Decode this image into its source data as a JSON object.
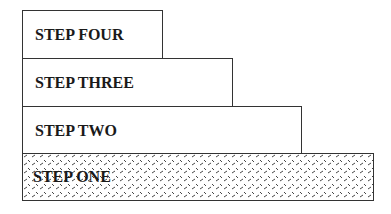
{
  "diagram": {
    "type": "staircase",
    "steps": [
      {
        "label": "STEP ONE",
        "fill": "diamond-hatch"
      },
      {
        "label": "STEP TWO",
        "fill": "none"
      },
      {
        "label": "STEP THREE",
        "fill": "none"
      },
      {
        "label": "STEP FOUR",
        "fill": "none"
      }
    ]
  }
}
